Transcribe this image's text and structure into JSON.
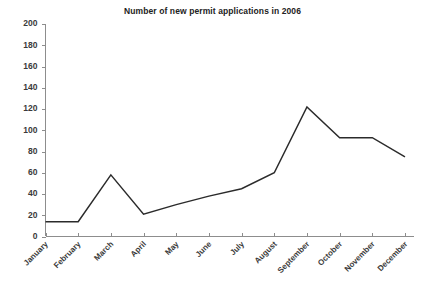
{
  "chart_data": {
    "type": "line",
    "title": "Number of new permit applications in 2006",
    "xlabel": "",
    "ylabel": "",
    "categories": [
      "January",
      "February",
      "March",
      "April",
      "May",
      "June",
      "July",
      "August",
      "September",
      "October",
      "November",
      "December"
    ],
    "values": [
      14,
      14,
      58,
      21,
      30,
      38,
      45,
      60,
      122,
      93,
      93,
      75
    ],
    "series": [
      {
        "name": "New permit applications",
        "values": [
          14,
          14,
          58,
          21,
          30,
          38,
          45,
          60,
          122,
          93,
          93,
          75
        ]
      }
    ],
    "ylim": [
      0,
      200
    ],
    "ytick_values": [
      0,
      20,
      40,
      60,
      80,
      100,
      120,
      140,
      160,
      180,
      200
    ],
    "ytick_labels": [
      "0",
      "20",
      "40",
      "60",
      "80",
      "100",
      "120",
      "140",
      "160",
      "180",
      "200"
    ],
    "ytick_step": 20,
    "grid": false,
    "legend": "none",
    "line_color": "#2b2b2b",
    "axis_color": "#8d8d8d",
    "text_color": "#3a3a3a",
    "xtick_label_rotation": -45,
    "markers": false
  }
}
